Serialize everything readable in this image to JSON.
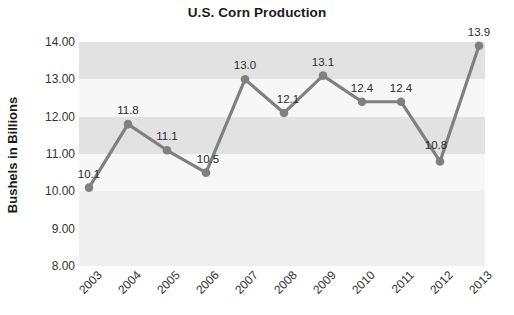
{
  "chart_data": {
    "type": "line",
    "title": "U.S. Corn Production",
    "xlabel": "",
    "ylabel": "Bushels in Billions",
    "categories": [
      "2003",
      "2004",
      "2005",
      "2006",
      "2007",
      "2008",
      "2009",
      "2010",
      "2011",
      "2012",
      "2013"
    ],
    "values": [
      10.1,
      11.8,
      11.1,
      10.5,
      13.0,
      12.1,
      13.1,
      12.4,
      12.4,
      10.8,
      13.9
    ],
    "point_labels": [
      "10.1",
      "11.8",
      "11.1",
      "10.5",
      "13.0",
      "12.1",
      "13.1",
      "12.4",
      "12.4",
      "10.8",
      "13.9"
    ],
    "ylim": [
      8.0,
      14.0
    ],
    "ytick_labels": [
      "14.00",
      "13.00",
      "12.00",
      "11.00",
      "10.00",
      "9.00",
      "8.00"
    ],
    "ytick_values": [
      14.0,
      13.0,
      12.0,
      11.0,
      10.0,
      9.0,
      8.0
    ],
    "grid": false,
    "banded_background": true,
    "legend": null,
    "series_color": "#808080",
    "marker": "circle",
    "colors": {
      "line": "#808080",
      "marker": "#808080",
      "band_dark": "#e2e2e2",
      "band_light": "#f7f7f7",
      "plot_base": "#efefef",
      "title_text": "#1a1a1a",
      "tick_text": "#333333",
      "page_background": "#ffffff"
    }
  }
}
